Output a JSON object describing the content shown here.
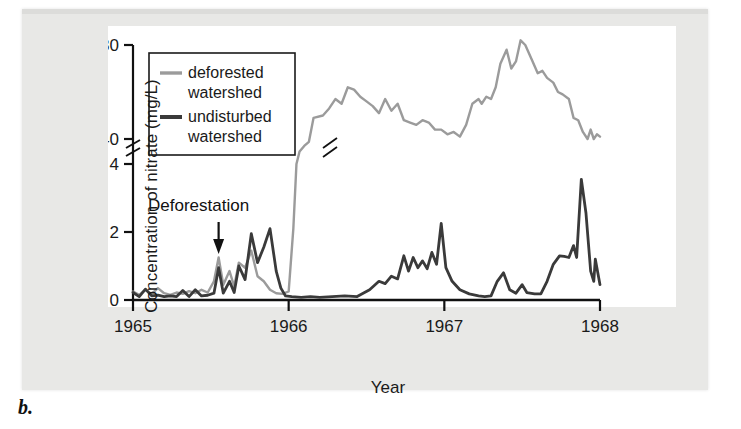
{
  "figure": {
    "panel_letter": "b.",
    "background_color": "#e8e8e6",
    "plot_background_color": "#ffffff"
  },
  "chart_data": {
    "type": "line",
    "title": "",
    "xlabel": "Year",
    "ylabel": "Concentration of nitrate (mg/L)",
    "xlim": [
      1965.0,
      1968.0
    ],
    "x_ticks": [
      "1965",
      "1966",
      "1967",
      "1968"
    ],
    "x_tick_values": [
      1965,
      1966,
      1967,
      1968
    ],
    "y_ticks": [
      "0",
      "2",
      "4",
      "40",
      "80"
    ],
    "y_tick_values": [
      0,
      2,
      4,
      40,
      80
    ],
    "y_axis_break": {
      "present": true,
      "between": [
        4,
        40
      ],
      "note": "broken axis: lower segment 0-4 mg/L, upper segment 40-80 mg/L"
    },
    "grid": false,
    "legend_position": "upper-left",
    "series": [
      {
        "name": "deforested watershed",
        "label_line1": "deforested",
        "label_line2": "watershed",
        "color": "#9b9b9b",
        "line_width": 2.4,
        "has_axis_break_marker": true,
        "points": [
          [
            1965.0,
            0.25
          ],
          [
            1965.04,
            0.15
          ],
          [
            1965.08,
            0.3
          ],
          [
            1965.12,
            0.18
          ],
          [
            1965.16,
            0.35
          ],
          [
            1965.2,
            0.2
          ],
          [
            1965.24,
            0.15
          ],
          [
            1965.28,
            0.22
          ],
          [
            1965.32,
            0.18
          ],
          [
            1965.36,
            0.26
          ],
          [
            1965.4,
            0.2
          ],
          [
            1965.44,
            0.3
          ],
          [
            1965.48,
            0.22
          ],
          [
            1965.52,
            0.55
          ],
          [
            1965.55,
            1.25
          ],
          [
            1965.58,
            0.45
          ],
          [
            1965.62,
            0.85
          ],
          [
            1965.65,
            0.4
          ],
          [
            1965.68,
            1.1
          ],
          [
            1965.72,
            0.95
          ],
          [
            1965.76,
            1.45
          ],
          [
            1965.8,
            0.7
          ],
          [
            1965.84,
            0.55
          ],
          [
            1965.88,
            0.3
          ],
          [
            1965.92,
            0.2
          ],
          [
            1965.96,
            0.18
          ],
          [
            1966.0,
            0.25
          ],
          [
            1966.03,
            2.1
          ],
          [
            1966.05,
            4.0
          ],
          [
            1966.07,
            22.0
          ],
          [
            1966.1,
            30.0
          ],
          [
            1966.13,
            36.0
          ],
          [
            1966.16,
            49.0
          ],
          [
            1966.22,
            50.0
          ],
          [
            1966.26,
            53.0
          ],
          [
            1966.3,
            57.0
          ],
          [
            1966.34,
            55.0
          ],
          [
            1966.38,
            62.0
          ],
          [
            1966.42,
            61.0
          ],
          [
            1966.46,
            58.0
          ],
          [
            1966.5,
            56.0
          ],
          [
            1966.54,
            54.0
          ],
          [
            1966.58,
            51.0
          ],
          [
            1966.62,
            57.0
          ],
          [
            1966.66,
            52.0
          ],
          [
            1966.7,
            55.0
          ],
          [
            1966.74,
            48.0
          ],
          [
            1966.78,
            47.0
          ],
          [
            1966.82,
            46.0
          ],
          [
            1966.86,
            48.0
          ],
          [
            1966.9,
            47.0
          ],
          [
            1966.94,
            44.0
          ],
          [
            1966.98,
            44.0
          ],
          [
            1967.02,
            42.0
          ],
          [
            1967.06,
            43.0
          ],
          [
            1967.1,
            41.0
          ],
          [
            1967.14,
            46.0
          ],
          [
            1967.18,
            55.0
          ],
          [
            1967.22,
            57.0
          ],
          [
            1967.24,
            55.0
          ],
          [
            1967.27,
            58.0
          ],
          [
            1967.3,
            57.0
          ],
          [
            1967.33,
            62.0
          ],
          [
            1967.36,
            72.0
          ],
          [
            1967.4,
            78.0
          ],
          [
            1967.43,
            70.0
          ],
          [
            1967.46,
            73.0
          ],
          [
            1967.49,
            82.0
          ],
          [
            1967.52,
            80.0
          ],
          [
            1967.56,
            74.0
          ],
          [
            1967.6,
            68.0
          ],
          [
            1967.63,
            69.0
          ],
          [
            1967.66,
            66.0
          ],
          [
            1967.7,
            64.0
          ],
          [
            1967.73,
            60.0
          ],
          [
            1967.76,
            59.0
          ],
          [
            1967.8,
            57.0
          ],
          [
            1967.83,
            49.0
          ],
          [
            1967.86,
            48.0
          ],
          [
            1967.89,
            43.0
          ],
          [
            1967.92,
            40.0
          ],
          [
            1967.94,
            44.0
          ],
          [
            1967.96,
            40.0
          ],
          [
            1967.98,
            42.0
          ],
          [
            1968.0,
            41.0
          ]
        ]
      },
      {
        "name": "undisturbed watershed",
        "label_line1": "undisturbed",
        "label_line2": "watershed",
        "color": "#3a3a3a",
        "line_width": 2.8,
        "has_axis_break_marker": false,
        "points": [
          [
            1965.0,
            0.22
          ],
          [
            1965.04,
            0.1
          ],
          [
            1965.08,
            0.32
          ],
          [
            1965.12,
            0.12
          ],
          [
            1965.16,
            0.14
          ],
          [
            1965.2,
            0.1
          ],
          [
            1965.24,
            0.12
          ],
          [
            1965.28,
            0.1
          ],
          [
            1965.32,
            0.28
          ],
          [
            1965.36,
            0.1
          ],
          [
            1965.4,
            0.3
          ],
          [
            1965.44,
            0.12
          ],
          [
            1965.48,
            0.14
          ],
          [
            1965.52,
            0.2
          ],
          [
            1965.55,
            0.95
          ],
          [
            1965.58,
            0.2
          ],
          [
            1965.62,
            0.55
          ],
          [
            1965.65,
            0.22
          ],
          [
            1965.68,
            1.0
          ],
          [
            1965.72,
            0.6
          ],
          [
            1965.76,
            1.95
          ],
          [
            1965.8,
            1.1
          ],
          [
            1965.84,
            1.55
          ],
          [
            1965.88,
            2.1
          ],
          [
            1965.92,
            0.85
          ],
          [
            1965.95,
            0.35
          ],
          [
            1965.98,
            0.12
          ],
          [
            1966.02,
            0.1
          ],
          [
            1966.08,
            0.08
          ],
          [
            1966.14,
            0.1
          ],
          [
            1966.2,
            0.08
          ],
          [
            1966.28,
            0.1
          ],
          [
            1966.36,
            0.12
          ],
          [
            1966.44,
            0.1
          ],
          [
            1966.52,
            0.3
          ],
          [
            1966.58,
            0.55
          ],
          [
            1966.62,
            0.48
          ],
          [
            1966.66,
            0.7
          ],
          [
            1966.7,
            0.62
          ],
          [
            1966.74,
            1.3
          ],
          [
            1966.77,
            0.85
          ],
          [
            1966.8,
            1.25
          ],
          [
            1966.83,
            0.95
          ],
          [
            1966.86,
            1.15
          ],
          [
            1966.89,
            0.92
          ],
          [
            1966.92,
            1.4
          ],
          [
            1966.95,
            1.05
          ],
          [
            1966.98,
            2.25
          ],
          [
            1967.01,
            0.95
          ],
          [
            1967.05,
            0.55
          ],
          [
            1967.1,
            0.3
          ],
          [
            1967.16,
            0.18
          ],
          [
            1967.22,
            0.12
          ],
          [
            1967.26,
            0.1
          ],
          [
            1967.3,
            0.12
          ],
          [
            1967.34,
            0.55
          ],
          [
            1967.38,
            0.8
          ],
          [
            1967.42,
            0.3
          ],
          [
            1967.46,
            0.2
          ],
          [
            1967.5,
            0.45
          ],
          [
            1967.53,
            0.22
          ],
          [
            1967.58,
            0.18
          ],
          [
            1967.62,
            0.18
          ],
          [
            1967.66,
            0.55
          ],
          [
            1967.7,
            1.05
          ],
          [
            1967.74,
            1.3
          ],
          [
            1967.77,
            1.28
          ],
          [
            1967.8,
            1.25
          ],
          [
            1967.83,
            1.6
          ],
          [
            1967.85,
            1.25
          ],
          [
            1967.88,
            3.55
          ],
          [
            1967.91,
            2.55
          ],
          [
            1967.94,
            0.85
          ],
          [
            1967.96,
            0.55
          ],
          [
            1967.97,
            1.2
          ],
          [
            1968.0,
            0.45
          ]
        ]
      }
    ],
    "annotations": [
      {
        "name": "deforestation",
        "text": "Deforestation",
        "x": 1965.55,
        "arrow": true,
        "arrow_direction": "down"
      }
    ]
  }
}
